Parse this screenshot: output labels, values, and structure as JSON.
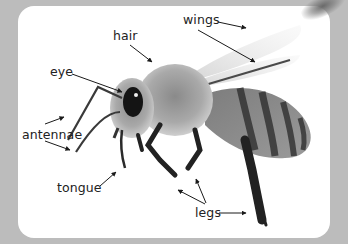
{
  "diagram": {
    "labels": [
      {
        "id": "hair",
        "text": "hair"
      },
      {
        "id": "wings",
        "text": "wings"
      },
      {
        "id": "eye",
        "text": "eye"
      },
      {
        "id": "antennae",
        "text": "antennae"
      },
      {
        "id": "tongue",
        "text": "tongue"
      },
      {
        "id": "legs",
        "text": "legs"
      }
    ]
  },
  "colors": {
    "background": "#bcbcbc",
    "card": "#ffffff",
    "text": "#222222"
  }
}
